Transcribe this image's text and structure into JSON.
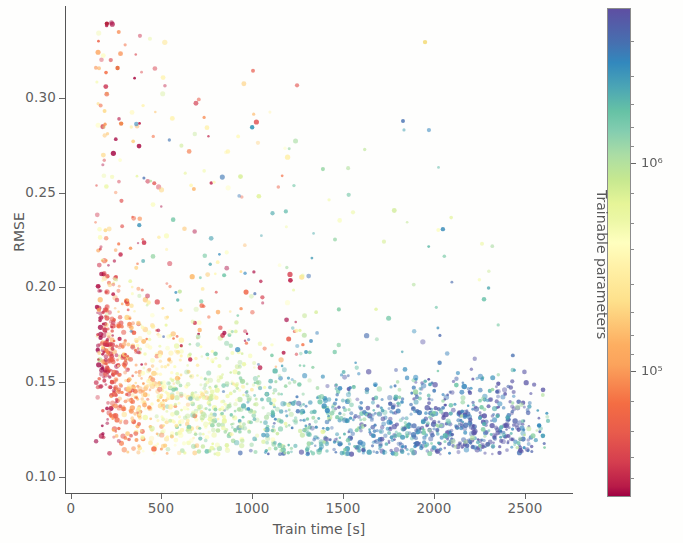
{
  "figure": {
    "background": "#fefefd",
    "width": 683,
    "height": 543
  },
  "axes": {
    "xlabel": "Train time [s]",
    "ylabel": "RMSE",
    "x_ticks": [
      0,
      500,
      1000,
      1500,
      2000,
      2500
    ],
    "x_tick_labels": [
      "0",
      "500",
      "1000",
      "1500",
      "2000",
      "2500"
    ],
    "y_ticks": [
      0.1,
      0.15,
      0.2,
      0.25,
      0.3
    ],
    "y_tick_labels": [
      "0.10",
      "0.15",
      "0.20",
      "0.25",
      "0.30"
    ],
    "xlim": [
      -60,
      2790
    ],
    "ylim": [
      0.083,
      0.3465
    ],
    "grid": false
  },
  "colorbar": {
    "title": "Trainable parameters",
    "scale": "log",
    "colormap": "Spectral",
    "tick_labels": [
      "10⁵",
      "10⁶"
    ],
    "tick_values": [
      100000,
      1000000
    ],
    "vmin": 30000,
    "vmax": 4500000,
    "low_color": "#9e0142",
    "mid_color": "#ffffbf",
    "high_color": "#5e4fa2"
  },
  "chart_data": {
    "type": "scatter",
    "title": "",
    "xlabel": "Train time [s]",
    "ylabel": "RMSE",
    "xlim": [
      -60,
      2790
    ],
    "ylim": [
      0.083,
      0.3465
    ],
    "grid": false,
    "legend": "colorbar-right",
    "color_variable": "Trainable parameters",
    "color_scale": "log",
    "colormap": "Spectral",
    "point_count_approx": 1600,
    "marker_size_px": 3,
    "series": [
      {
        "name": "models",
        "cluster_bands": [
          {
            "x_range": [
              120,
              350
            ],
            "y_range": [
              0.145,
              0.34
            ],
            "param_range": [
              40000,
              160000
            ],
            "density": "sparse-red"
          },
          {
            "x_range": [
              200,
              600
            ],
            "y_range": [
              0.125,
              0.2
            ],
            "param_range": [
              60000,
              400000
            ],
            "density": "dense-orange-yellow"
          },
          {
            "x_range": [
              550,
              1200
            ],
            "y_range": [
              0.115,
              0.175
            ],
            "param_range": [
              200000,
              900000
            ],
            "density": "dense-yellow-green"
          },
          {
            "x_range": [
              1000,
              1800
            ],
            "y_range": [
              0.11,
              0.155
            ],
            "param_range": [
              500000,
              2000000
            ],
            "density": "dense-teal"
          },
          {
            "x_range": [
              1700,
              2600
            ],
            "y_range": [
              0.108,
              0.145
            ],
            "param_range": [
              900000,
              3000000
            ],
            "density": "sparse-blue"
          }
        ]
      }
    ],
    "notable_points": [
      {
        "x": 175,
        "y": 0.337,
        "color": "#b5253f",
        "note": "highest RMSE outlier"
      },
      {
        "x": 235,
        "y": 0.313,
        "color": "#e8764a"
      },
      {
        "x": 255,
        "y": 0.283,
        "color": "#f08a52"
      },
      {
        "x": 990,
        "y": 0.281,
        "color": "#4aa3c0"
      },
      {
        "x": 1960,
        "y": 0.327,
        "color": "#f5e08a"
      },
      {
        "x": 2060,
        "y": 0.226,
        "color": "#5a9fc4"
      },
      {
        "x": 2600,
        "y": 0.12,
        "color": "#3f8fbd",
        "note": "longest train time"
      }
    ]
  }
}
